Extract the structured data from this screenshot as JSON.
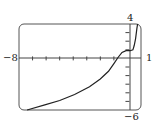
{
  "chart_data": {
    "type": "line",
    "title": "",
    "xlabel": "",
    "ylabel": "",
    "xlim": [
      -8,
      1
    ],
    "ylim": [
      -6,
      4
    ],
    "grid": false,
    "x_tick_step": 1,
    "y_tick_step": 1,
    "axis_labels": {
      "xmin": "−8",
      "xmax": "1",
      "ymin": "−6",
      "ymax": "4"
    },
    "series": [
      {
        "name": "curve",
        "x": [
          -7.4,
          -6.1,
          -5.0,
          -3.9,
          -2.8,
          -2.0,
          -1.4,
          -1.0,
          -0.7,
          -0.4,
          -0.1,
          0.2,
          0.4,
          0.5,
          0.6,
          0.7,
          0.75
        ],
        "y": [
          -6.0,
          -5.4,
          -4.9,
          -4.2,
          -3.3,
          -2.4,
          -1.5,
          -0.6,
          0.1,
          0.7,
          0.9,
          0.9,
          1.0,
          1.5,
          2.3,
          3.5,
          4.0
        ]
      }
    ]
  },
  "colors": {
    "axis": "#444444",
    "curve": "#222222",
    "frame": "#555555"
  }
}
